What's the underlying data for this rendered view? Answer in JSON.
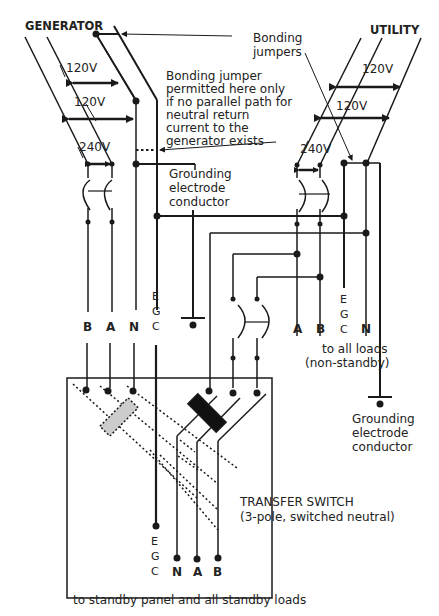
{
  "diagram": {
    "generator": {
      "title": "GENERATOR",
      "voltage_top": "120V",
      "voltage_mid": "120V",
      "voltage_240": "240V",
      "conductors": [
        "B",
        "A",
        "N"
      ],
      "egc": [
        "E",
        "G",
        "C"
      ]
    },
    "utility": {
      "title": "UTILITY",
      "voltage_top": "120V",
      "voltage_mid": "120V",
      "voltage_240": "240V",
      "conductors": [
        "A",
        "B",
        "N"
      ],
      "egc": [
        "E",
        "G",
        "C"
      ],
      "loads_line1": "to all loads",
      "loads_line2": "(non-standby)"
    },
    "annotations": {
      "bonding_jumpers_1": "Bonding",
      "bonding_jumpers_2": "jumpers",
      "bonding_note": [
        "Bonding jumper",
        "permitted here only",
        "if no parallel path for",
        "neutral return",
        "current to the",
        "generator exists"
      ],
      "gec_gen": [
        "Grounding",
        "electrode",
        "conductor"
      ],
      "gec_util": [
        "Grounding",
        "electrode",
        "conductor"
      ]
    },
    "transfer_switch": {
      "title": "TRANSFER SWITCH",
      "subtitle": "(3-pole, switched neutral)",
      "outputs": [
        "N",
        "A",
        "B"
      ],
      "egc": [
        "E",
        "G",
        "C"
      ]
    },
    "footer": "to standby panel and all standby loads"
  },
  "colors": {
    "line": "#1a1a1a",
    "switch_active": "#111111",
    "switch_inactive": "#cccccc"
  }
}
